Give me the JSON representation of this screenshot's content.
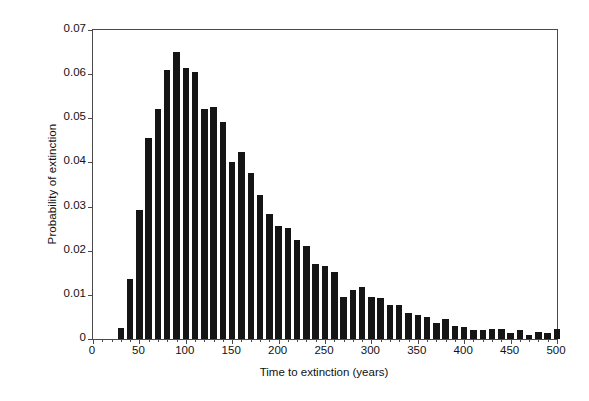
{
  "chart_data": {
    "type": "bar",
    "title": "",
    "subtitle": "",
    "xlabel": "Time to extinction (years)",
    "ylabel": "Probability of extinction",
    "xlim": [
      0,
      500
    ],
    "ylim": [
      0,
      0.07
    ],
    "grid": false,
    "legend": null,
    "bar_width_years": 7,
    "x_major_tick_step": 50,
    "x_minor_tick_step": 10,
    "y_tick_step": 0.01,
    "xtick_labels": [
      "0",
      "50",
      "100",
      "150",
      "200",
      "250",
      "300",
      "350",
      "400",
      "450",
      "500"
    ],
    "xtick_values": [
      0,
      50,
      100,
      150,
      200,
      250,
      300,
      350,
      400,
      450,
      500
    ],
    "ytick_labels": [
      "0",
      "0.01",
      "0.02",
      "0.03",
      "0.04",
      "0.05",
      "0.06",
      "0.07"
    ],
    "ytick_values": [
      0,
      0.01,
      0.02,
      0.03,
      0.04,
      0.05,
      0.06,
      0.07
    ],
    "categories": [
      30,
      40,
      50,
      60,
      70,
      80,
      90,
      100,
      110,
      120,
      130,
      140,
      150,
      160,
      170,
      180,
      190,
      200,
      210,
      220,
      230,
      240,
      250,
      260,
      270,
      280,
      290,
      300,
      310,
      320,
      330,
      340,
      350,
      360,
      370,
      380,
      390,
      400,
      410,
      420,
      430,
      440,
      450,
      460,
      470,
      480,
      490,
      500
    ],
    "values": [
      0.0025,
      0.0137,
      0.0293,
      0.0456,
      0.052,
      0.0609,
      0.0651,
      0.0613,
      0.0606,
      0.0521,
      0.0525,
      0.0492,
      0.04,
      0.0424,
      0.0377,
      0.0327,
      0.0284,
      0.0255,
      0.0251,
      0.0224,
      0.0211,
      0.0171,
      0.0165,
      0.0151,
      0.0096,
      0.011,
      0.0117,
      0.0095,
      0.0092,
      0.0076,
      0.0078,
      0.006,
      0.0055,
      0.0051,
      0.0036,
      0.0045,
      0.003,
      0.0028,
      0.002,
      0.0021,
      0.0022,
      0.0023,
      0.0013,
      0.002,
      0.001,
      0.0015,
      0.0014,
      0.0022
    ],
    "colors": {
      "bar": "#151515",
      "axis": "#4a4a4a",
      "text": "#111111",
      "background": "#ffffff"
    }
  }
}
